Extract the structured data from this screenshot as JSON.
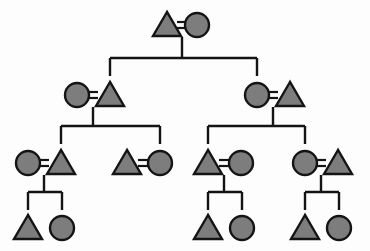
{
  "diagram": {
    "type": "pedigree",
    "canvas": {
      "width": 370,
      "height": 251
    },
    "background_color": "#fdfdfd",
    "shape_fill_color": "#7d7d7d",
    "shape_stroke_color": "#141414",
    "line_color": "#141414",
    "symbol_legend": {
      "triangle": "male",
      "circle": "female",
      "double-bar": "marriage / union",
      "vertical-line": "descent line",
      "horizontal-bar": "sibship line"
    },
    "generations": [
      {
        "id": "generation-1",
        "label": "Generation 1",
        "row_y": 25,
        "individuals": [
          {
            "id": "g1-m1",
            "shape": "triangle",
            "sex": "male",
            "cx": 167,
            "cy": 25,
            "size": 24
          },
          {
            "id": "g1-f1",
            "shape": "circle",
            "sex": "female",
            "cx": 197,
            "cy": 25,
            "size": 24
          }
        ],
        "unions": [
          {
            "id": "union-g1",
            "left": "g1-m1",
            "right": "g1-f1",
            "eq_x": 182,
            "eq_y": 25
          }
        ]
      },
      {
        "id": "generation-2",
        "label": "Generation 2",
        "row_y": 95,
        "individuals": [
          {
            "id": "g2-f1",
            "shape": "circle",
            "sex": "female",
            "cx": 77,
            "cy": 95,
            "size": 24
          },
          {
            "id": "g2-m1",
            "shape": "triangle",
            "sex": "male",
            "cx": 110,
            "cy": 95,
            "size": 24
          },
          {
            "id": "g2-f2",
            "shape": "circle",
            "sex": "female",
            "cx": 257,
            "cy": 95,
            "size": 24
          },
          {
            "id": "g2-m2",
            "shape": "triangle",
            "sex": "male",
            "cx": 290,
            "cy": 95,
            "size": 24
          }
        ],
        "unions": [
          {
            "id": "union-g2-left",
            "left": "g2-f1",
            "right": "g2-m1",
            "eq_x": 93,
            "eq_y": 95
          },
          {
            "id": "union-g2-right",
            "left": "g2-f2",
            "right": "g2-m2",
            "eq_x": 273,
            "eq_y": 95
          }
        ]
      },
      {
        "id": "generation-3",
        "label": "Generation 3",
        "row_y": 163,
        "individuals": [
          {
            "id": "g3-f1",
            "shape": "circle",
            "sex": "female",
            "cx": 28,
            "cy": 163,
            "size": 24
          },
          {
            "id": "g3-m1",
            "shape": "triangle",
            "sex": "male",
            "cx": 61,
            "cy": 163,
            "size": 24
          },
          {
            "id": "g3-m2",
            "shape": "triangle",
            "sex": "male",
            "cx": 127,
            "cy": 163,
            "size": 24
          },
          {
            "id": "g3-f2",
            "shape": "circle",
            "sex": "female",
            "cx": 160,
            "cy": 163,
            "size": 24
          },
          {
            "id": "g3-m3",
            "shape": "triangle",
            "sex": "male",
            "cx": 208,
            "cy": 163,
            "size": 24
          },
          {
            "id": "g3-f3",
            "shape": "circle",
            "sex": "female",
            "cx": 241,
            "cy": 163,
            "size": 24
          },
          {
            "id": "g3-f4",
            "shape": "circle",
            "sex": "female",
            "cx": 305,
            "cy": 163,
            "size": 24
          },
          {
            "id": "g3-m4",
            "shape": "triangle",
            "sex": "male",
            "cx": 338,
            "cy": 163,
            "size": 24
          }
        ],
        "unions": [
          {
            "id": "union-g3-a",
            "left": "g3-f1",
            "right": "g3-m1",
            "eq_x": 44,
            "eq_y": 163
          },
          {
            "id": "union-g3-b",
            "left": "g3-m2",
            "right": "g3-f2",
            "eq_x": 143,
            "eq_y": 163
          },
          {
            "id": "union-g3-c",
            "left": "g3-m3",
            "right": "g3-f3",
            "eq_x": 224,
            "eq_y": 163
          },
          {
            "id": "union-g3-d",
            "left": "g3-f4",
            "right": "g3-m4",
            "eq_x": 321,
            "eq_y": 163
          }
        ]
      },
      {
        "id": "generation-4",
        "label": "Generation 4",
        "row_y": 228,
        "individuals": [
          {
            "id": "g4-m1",
            "shape": "triangle",
            "sex": "male",
            "cx": 28,
            "cy": 228,
            "size": 24
          },
          {
            "id": "g4-f1",
            "shape": "circle",
            "sex": "female",
            "cx": 62,
            "cy": 228,
            "size": 24
          },
          {
            "id": "g4-m2",
            "shape": "triangle",
            "sex": "male",
            "cx": 208,
            "cy": 228,
            "size": 24
          },
          {
            "id": "g4-f2",
            "shape": "circle",
            "sex": "female",
            "cx": 242,
            "cy": 228,
            "size": 24
          },
          {
            "id": "g4-m3",
            "shape": "triangle",
            "sex": "male",
            "cx": 305,
            "cy": 228,
            "size": 24
          },
          {
            "id": "g4-f3",
            "shape": "circle",
            "sex": "female",
            "cx": 339,
            "cy": 228,
            "size": 24
          }
        ],
        "unions": []
      }
    ],
    "descent_groups": [
      {
        "id": "descent-g1",
        "from_union": "union-g1",
        "drop_from_y": 37,
        "bar_y": 58,
        "bar_x1": 110,
        "bar_x2": 257,
        "child_x": [
          110,
          257
        ]
      },
      {
        "id": "descent-g2-left",
        "from_union": "union-g2-left",
        "drop_from_y": 107,
        "bar_y": 126,
        "bar_x1": 61,
        "bar_x2": 160,
        "child_x": [
          61,
          160
        ]
      },
      {
        "id": "descent-g2-right",
        "from_union": "union-g2-right",
        "drop_from_y": 107,
        "bar_y": 126,
        "bar_x1": 208,
        "bar_x2": 305,
        "child_x": [
          208,
          305
        ]
      },
      {
        "id": "descent-g3-a",
        "from_union": "union-g3-a",
        "drop_from_y": 175,
        "bar_y": 192,
        "bar_x1": 28,
        "bar_x2": 62,
        "child_x": [
          28,
          62
        ]
      },
      {
        "id": "descent-g3-c",
        "from_union": "union-g3-c",
        "drop_from_y": 175,
        "bar_y": 192,
        "bar_x1": 208,
        "bar_x2": 242,
        "child_x": [
          208,
          242
        ]
      },
      {
        "id": "descent-g3-d",
        "from_union": "union-g3-d",
        "drop_from_y": 175,
        "bar_y": 192,
        "bar_x1": 305,
        "bar_x2": 339,
        "child_x": [
          305,
          339
        ]
      }
    ]
  }
}
